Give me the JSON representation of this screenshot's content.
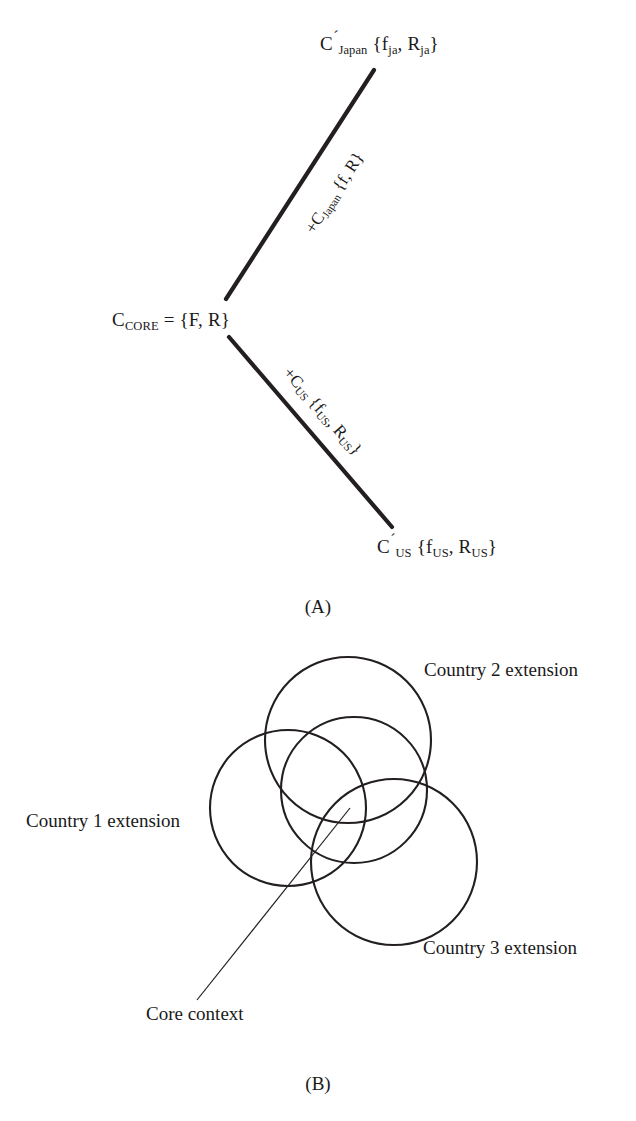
{
  "figure": {
    "panel_a": {
      "caption": "(A)",
      "nodes": [
        {
          "id": "japan-extension",
          "text": "C´Japan {fja, Rja}",
          "parts": {
            "base": "C",
            "prime": "´",
            "sub": "Japan",
            "set": " {f",
            "sub2": "ja",
            "mid": ", R",
            "sub3": "ja",
            "close": "}"
          },
          "x": 320,
          "y": 30
        },
        {
          "id": "core-context",
          "text": "CCORE = {F, R}",
          "parts": {
            "base": "C",
            "sub": "CORE",
            "rest": " = {F, R}"
          },
          "x": 112,
          "y": 310
        },
        {
          "id": "us-extension",
          "text": "C´US {fUS, RUS}",
          "parts": {
            "base": "C",
            "prime": "´",
            "sub": "US",
            "set": " {f",
            "sub2": "US",
            "mid": ", R",
            "sub3": "US",
            "close": "}"
          },
          "x": 377,
          "y": 533
        }
      ],
      "edges": [
        {
          "id": "edge-japan",
          "label_base": "+C",
          "label_sub": "Japan",
          "label_rest": " {f, R}",
          "x1": 226,
          "y1": 299,
          "x2": 374,
          "y2": 70
        },
        {
          "id": "edge-us",
          "label_base": "+C",
          "label_sub": "US",
          "label_set": " {f",
          "label_sub2": "US",
          "label_mid": ", R",
          "label_sub3": "US",
          "label_close": "}",
          "x1": 229,
          "y1": 337,
          "x2": 392,
          "y2": 527
        }
      ]
    },
    "panel_b": {
      "caption": "(B)",
      "circles": [
        {
          "id": "country-1-circle",
          "cx": 288,
          "cy": 808,
          "r": 78
        },
        {
          "id": "country-2-circle",
          "cx": 348,
          "cy": 740,
          "r": 83
        },
        {
          "id": "country-3-circle",
          "cx": 394,
          "cy": 862,
          "r": 83
        },
        {
          "id": "core-circle",
          "cx": 354,
          "cy": 790,
          "r": 73
        }
      ],
      "labels": [
        {
          "id": "country-2-extension",
          "text": "Country 2 extension",
          "x": 424,
          "y": 660
        },
        {
          "id": "country-1-extension",
          "text": "Country 1 extension",
          "x": 26,
          "y": 811
        },
        {
          "id": "country-3-extension",
          "text": "Country 3 extension",
          "x": 423,
          "y": 938
        },
        {
          "id": "core-context-label",
          "text": "Core context",
          "x": 146,
          "y": 1004
        }
      ],
      "leader_line": {
        "x1": 197,
        "y1": 1000,
        "x2": 350,
        "y2": 808
      }
    }
  },
  "colors": {
    "stroke": "#231f20",
    "ink": "#1a1a1a",
    "background": "#ffffff"
  }
}
